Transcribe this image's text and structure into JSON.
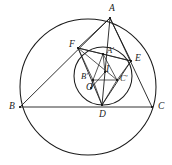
{
  "figure": {
    "background_color": "#ffffff",
    "stroke_color": "#1b1b1b",
    "label_color": "#1a1a1a",
    "width": 172,
    "height": 165
  },
  "circles": [
    {
      "name": "circumcircle",
      "cx": 88,
      "cy": 87,
      "r": 68,
      "stroke": "#1b1b1b",
      "stroke_width": 1.05
    },
    {
      "name": "incircle",
      "cx": 103,
      "cy": 76,
      "r": 29,
      "stroke": "#1b1b1b",
      "stroke_width": 1.05
    }
  ],
  "points": [
    {
      "id": "A",
      "label": "A",
      "x": 110,
      "y": 18,
      "lx": 109,
      "ly": 4,
      "anchor": "center"
    },
    {
      "id": "B",
      "label": "B",
      "x": 20,
      "y": 107,
      "lx": 9,
      "ly": 102,
      "anchor": "center"
    },
    {
      "id": "C",
      "label": "C",
      "x": 152,
      "y": 107,
      "lx": 158,
      "ly": 102,
      "anchor": "center"
    },
    {
      "id": "D",
      "label": "D",
      "x": 102,
      "y": 105,
      "lx": 99,
      "ly": 110,
      "anchor": "center"
    },
    {
      "id": "E",
      "label": "E",
      "x": 131,
      "y": 61,
      "lx": 135,
      "ly": 54,
      "anchor": "center"
    },
    {
      "id": "F",
      "label": "F",
      "x": 78,
      "y": 48,
      "lx": 69,
      "ly": 40,
      "anchor": "center"
    },
    {
      "id": "Ap",
      "label": "A'",
      "x": 103,
      "y": 54,
      "lx": 107,
      "ly": 46,
      "anchor": "center"
    },
    {
      "id": "Bp",
      "label": "B'",
      "x": 93,
      "y": 80,
      "lx": 81,
      "ly": 72,
      "anchor": "center"
    },
    {
      "id": "Cp",
      "label": "C'",
      "x": 117,
      "y": 80,
      "lx": 120,
      "ly": 74,
      "anchor": "center"
    },
    {
      "id": "I",
      "label": "I",
      "x": 105,
      "y": 72,
      "lx": 106,
      "ly": 65,
      "anchor": "center"
    },
    {
      "id": "O",
      "label": "O",
      "x": 91,
      "y": 88,
      "lx": 86,
      "ly": 83,
      "anchor": "center"
    }
  ],
  "segments": [
    {
      "name": "side-AB",
      "from": "A",
      "to": "B",
      "weight": "normal"
    },
    {
      "name": "side-BC",
      "from": "B",
      "to": "C",
      "weight": "normal"
    },
    {
      "name": "side-CA",
      "from": "C",
      "to": "A",
      "weight": "normal"
    },
    {
      "name": "contact-EF",
      "from": "E",
      "to": "F",
      "weight": "normal"
    },
    {
      "name": "contact-FD",
      "from": "F",
      "to": "D",
      "weight": "normal"
    },
    {
      "name": "contact-DE",
      "from": "D",
      "to": "E",
      "weight": "normal"
    },
    {
      "name": "cevian-A-D",
      "from": "A",
      "to": "D",
      "weight": "normal"
    },
    {
      "name": "chord-A-F",
      "from": "A",
      "to": "F",
      "weight": "normal"
    },
    {
      "name": "chord-A-E",
      "from": "A",
      "to": "E",
      "weight": "normal"
    },
    {
      "name": "inner-ApBp",
      "from": "Ap",
      "to": "Bp",
      "weight": "thin"
    },
    {
      "name": "inner-BpCp",
      "from": "Bp",
      "to": "Cp",
      "weight": "thin"
    },
    {
      "name": "inner-CpAp",
      "from": "Cp",
      "to": "Ap",
      "weight": "thin"
    },
    {
      "name": "spoke-F-Ap",
      "from": "F",
      "to": "Ap",
      "weight": "thin"
    },
    {
      "name": "spoke-F-Bp",
      "from": "F",
      "to": "Bp",
      "weight": "thin"
    },
    {
      "name": "spoke-F-Cp",
      "from": "F",
      "to": "Cp",
      "weight": "thin"
    },
    {
      "name": "spoke-E-Ap",
      "from": "E",
      "to": "Ap",
      "weight": "thin"
    },
    {
      "name": "spoke-E-Cp",
      "from": "E",
      "to": "Cp",
      "weight": "thin"
    },
    {
      "name": "spoke-D-Bp",
      "from": "D",
      "to": "Bp",
      "weight": "thin"
    },
    {
      "name": "spoke-D-Cp",
      "from": "D",
      "to": "Cp",
      "weight": "thin"
    },
    {
      "name": "spoke-Ap-I",
      "from": "Ap",
      "to": "I",
      "weight": "thin"
    },
    {
      "name": "spoke-I-O",
      "from": "I",
      "to": "O",
      "weight": "thin"
    },
    {
      "name": "spoke-O-Bp",
      "from": "O",
      "to": "Bp",
      "weight": "thin"
    }
  ]
}
